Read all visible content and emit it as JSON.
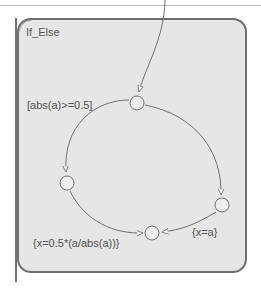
{
  "state": {
    "name": "If_Else",
    "fill": "#e6e6e6",
    "border": "#6e6e6e"
  },
  "junctions": [
    {
      "id": "top",
      "cx": 137,
      "cy": 103
    },
    {
      "id": "left",
      "cx": 67,
      "cy": 183
    },
    {
      "id": "bottom",
      "cx": 152,
      "cy": 233
    },
    {
      "id": "right",
      "cx": 222,
      "cy": 205
    }
  ],
  "transitions": {
    "default_entry": {
      "from": "outside-top",
      "to": "top"
    },
    "if_branch": {
      "from": "top",
      "to": "left",
      "label": "[abs(a)>=0.5]"
    },
    "if_action": {
      "from": "left",
      "to": "bottom",
      "label": "{x=0.5*(a/abs(a))}"
    },
    "else_branch": {
      "from": "top",
      "to": "right",
      "label": ""
    },
    "else_action": {
      "from": "right",
      "to": "bottom",
      "label": "{x=a}"
    }
  },
  "labels": {
    "condition": "[abs(a)>=0.5]",
    "if_action": "{x=0.5*(a/abs(a))}",
    "else_action": "{x=a}"
  }
}
